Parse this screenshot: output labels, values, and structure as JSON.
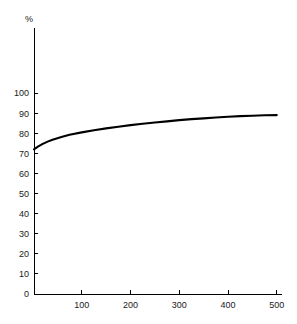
{
  "chart_data": {
    "type": "line",
    "title": "",
    "subtitle": "",
    "xlabel": "",
    "ylabel": "%",
    "unit_label": "%",
    "xlim": [
      0,
      515
    ],
    "ylim": [
      0,
      105
    ],
    "grid": false,
    "legend": null,
    "legend_position": "none",
    "background_color": "#ffffff",
    "line_color": "#000000",
    "axis_color": "#000000",
    "xticks": [
      100,
      200,
      300,
      400,
      500
    ],
    "xtick_labels": [
      "100",
      "200",
      "300",
      "400",
      "500"
    ],
    "yticks": [
      0,
      10,
      20,
      30,
      40,
      50,
      60,
      70,
      80,
      90,
      100
    ],
    "ytick_labels": [
      "0",
      "10",
      "20",
      "30",
      "40",
      "50",
      "60",
      "70",
      "80",
      "90",
      "100"
    ],
    "series": [
      {
        "name": "curve",
        "x": [
          2,
          10,
          20,
          30,
          40,
          50,
          60,
          75,
          100,
          125,
          150,
          175,
          200,
          225,
          250,
          275,
          300,
          325,
          350,
          375,
          400,
          425,
          450,
          475,
          500
        ],
        "y": [
          72.0,
          73.3,
          74.7,
          75.8,
          76.7,
          77.5,
          78.2,
          79.2,
          80.4,
          81.5,
          82.4,
          83.2,
          84.0,
          84.7,
          85.3,
          85.9,
          86.5,
          87.0,
          87.4,
          87.8,
          88.2,
          88.5,
          88.7,
          88.9,
          89.0
        ]
      }
    ],
    "annotations": []
  },
  "geometry": {
    "plot_left": 34,
    "plot_right": 282,
    "plot_top": 28,
    "plot_bottom": 294,
    "x_origin_px": 33,
    "x_scale_px_per_unit": 0.4875,
    "y_zero_px": 294,
    "y_scale_px_per_unit": 2.01
  }
}
